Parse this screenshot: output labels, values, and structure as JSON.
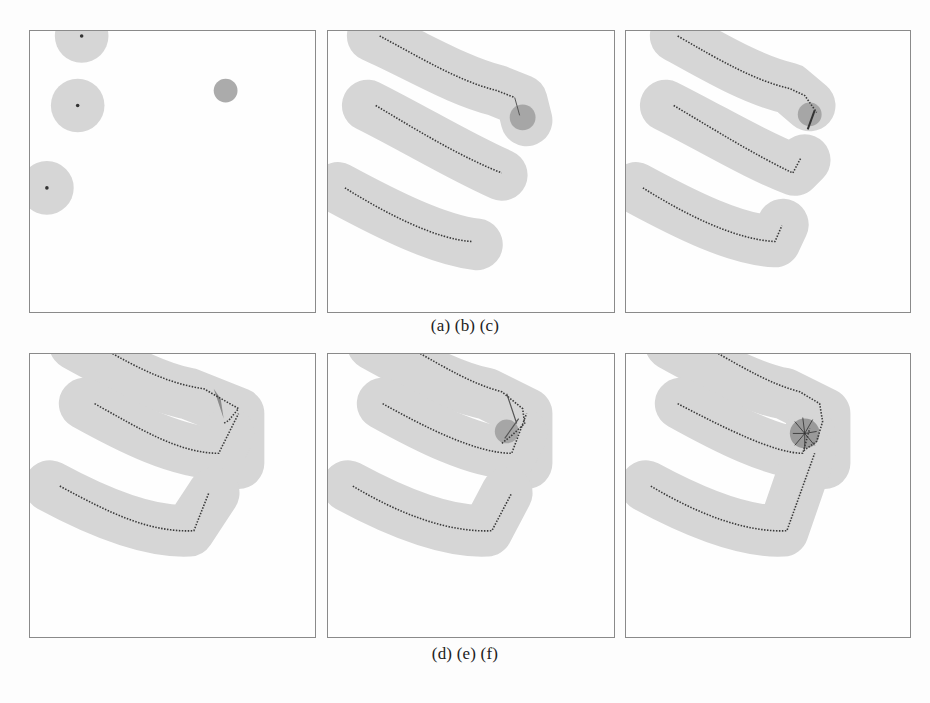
{
  "figure": {
    "captions": {
      "top_row": "(a) (b) (c)",
      "bottom_row": "(d) (e) (f)"
    },
    "panels": [
      {
        "id": "a",
        "label": "(a)",
        "description": "Initial UAV locations with coverage circles and a target"
      },
      {
        "id": "b",
        "label": "(b)",
        "description": "UAV trajectories with swept coverage, target detected"
      },
      {
        "id": "c",
        "label": "(c)",
        "description": "UAVs turning toward target"
      },
      {
        "id": "d",
        "label": "(d)",
        "description": "UAVs converging near target"
      },
      {
        "id": "e",
        "label": "(e)",
        "description": "UAVs circling target"
      },
      {
        "id": "f",
        "label": "(f)",
        "description": "UAVs encircling target with dense trajectories"
      }
    ],
    "colors": {
      "coverage": "#d4d4d4",
      "target": "#a8a8a8",
      "trajectory": "#3a3a3a",
      "border": "#8a8a8a"
    }
  }
}
